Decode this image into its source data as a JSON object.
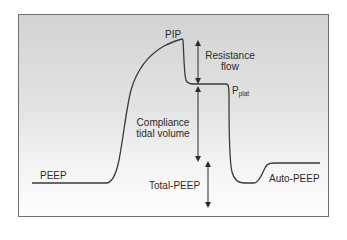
{
  "diagram": {
    "title": "",
    "type": "airway pressure waveform",
    "labels": {
      "pip": "PIP",
      "resistance_line1": "Resistance",
      "resistance_line2": "flow",
      "pplat_main": "P",
      "pplat_sub": "plat",
      "compliance_line1": "Compliance",
      "compliance_line2": "tidal volume",
      "peep": "PEEP",
      "total_peep": "Total-PEEP",
      "auto_peep": "Auto-PEEP"
    },
    "colors": {
      "curve": "#3a3a3a",
      "arrow": "#2b2b2b",
      "frame_border": "#6f6f6f",
      "background_top": "#d3d3d3",
      "background_bottom": "#fdfdfd"
    }
  }
}
